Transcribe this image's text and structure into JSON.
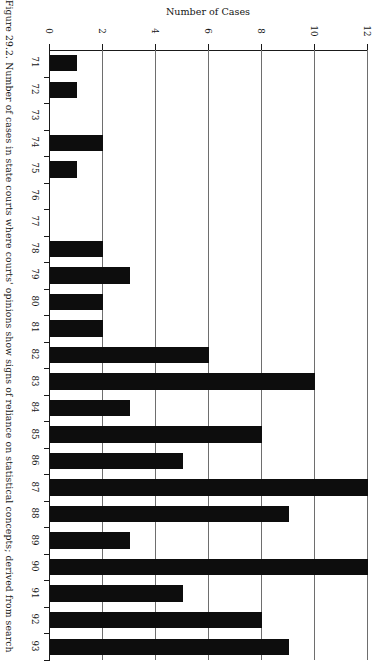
{
  "figure": {
    "caption": "Figure 29.2. Number of cases in state courts where courts' opinions show signs of reliance on statistical concepts; derived from search",
    "axis_title": "Number of Cases"
  },
  "chart_data": {
    "type": "bar",
    "orientation": "horizontal",
    "title": "Number of Cases",
    "xlabel": "Number of Cases",
    "ylabel": "",
    "xlim": [
      0,
      12
    ],
    "xticks": [
      0,
      2,
      4,
      6,
      8,
      10,
      12
    ],
    "xtick_labels": [
      "0",
      "2",
      "4",
      "6",
      "8",
      "10",
      "12"
    ],
    "grid": "vertical",
    "legend": "none",
    "categories": [
      "71",
      "72",
      "73",
      "74",
      "75",
      "76",
      "77",
      "78",
      "79",
      "80",
      "81",
      "82",
      "83",
      "84",
      "85",
      "86",
      "87",
      "88",
      "89",
      "90",
      "91",
      "92",
      "93"
    ],
    "values": [
      1,
      1,
      0,
      2,
      1,
      0,
      0,
      2,
      3,
      2,
      2,
      6,
      10,
      3,
      8,
      5,
      12,
      9,
      3,
      12,
      5,
      8,
      9
    ],
    "bar_color": "#0d0d0d"
  }
}
